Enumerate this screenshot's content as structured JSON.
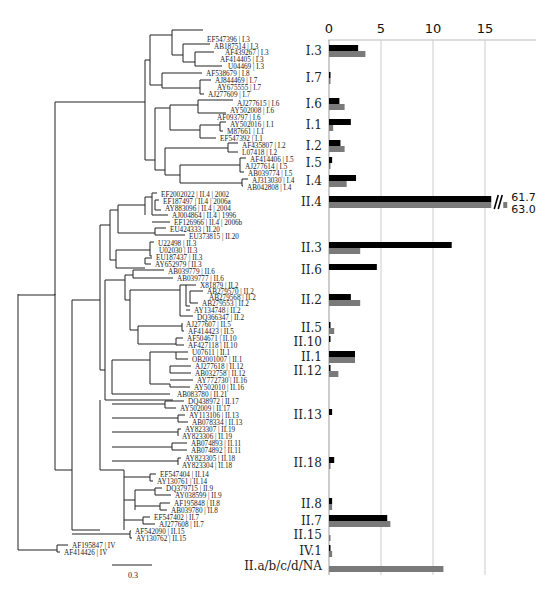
{
  "chart_data": {
    "type": "bar",
    "orientation": "horizontal",
    "title": "",
    "xlabel": "",
    "ylabel": "",
    "xlim": [
      0,
      20
    ],
    "x_ticks": [
      "0",
      "5",
      "10",
      "15"
    ],
    "grid": true,
    "legend": [],
    "categories": [
      "I.3",
      "I.7",
      "I.6",
      "I.1",
      "I.2",
      "I.5",
      "I.4",
      "II.4",
      "II.3",
      "II.6",
      "II.2",
      "II.5",
      "II.10",
      "II.1",
      "II.12",
      "II.13",
      "II.18",
      "II.8",
      "II.7",
      "II.15",
      "IV.1",
      "II.a/b/c/d/NA"
    ],
    "series": [
      {
        "name": "black",
        "color": "#000000",
        "values": [
          2.8,
          0.1,
          1.0,
          2.1,
          1.1,
          0.3,
          2.6,
          61.7,
          11.8,
          4.6,
          2.1,
          0.1,
          0.1,
          2.5,
          0.1,
          0.3,
          0.5,
          0.3,
          5.6,
          0.0,
          0.1,
          0.0
        ]
      },
      {
        "name": "gray",
        "color": "#7a7a7a",
        "values": [
          3.5,
          0.1,
          1.5,
          0.4,
          1.5,
          0.1,
          1.7,
          63.0,
          3.0,
          0.0,
          3.0,
          0.5,
          0.0,
          2.5,
          0.9,
          0.0,
          0.1,
          0.3,
          5.9,
          0.05,
          0.3,
          11.0
        ]
      }
    ],
    "annotations": [
      {
        "category": "II.4",
        "series": "black",
        "text": "61.7",
        "note": "axis break"
      },
      {
        "category": "II.4",
        "series": "gray",
        "text": "63.0",
        "note": "axis break"
      }
    ],
    "category_y": [
      51,
      78,
      104,
      125,
      146,
      163,
      181,
      202,
      248,
      270,
      300,
      328,
      342,
      357,
      371,
      415,
      463,
      504,
      521,
      535,
      551,
      566
    ]
  },
  "tree": {
    "scale_bar_label": "0.3",
    "leaves": [
      {
        "label": "EF547396 | I.3",
        "x": 205,
        "y": 39
      },
      {
        "label": "AB187514 | I.3",
        "x": 212,
        "y": 46
      },
      {
        "label": "AF439267 | I.3",
        "x": 223,
        "y": 52
      },
      {
        "label": "AF414405 | I.3",
        "x": 218,
        "y": 59
      },
      {
        "label": "U04469 | I.3",
        "x": 226,
        "y": 66
      },
      {
        "label": "AF538679 | I.8",
        "x": 204,
        "y": 73
      },
      {
        "label": "AJ844469 | I.7",
        "x": 213,
        "y": 80
      },
      {
        "label": "AY675555 | I.7",
        "x": 215,
        "y": 87
      },
      {
        "label": "AJ277609 | I.7",
        "x": 206,
        "y": 94
      },
      {
        "label": "AJ277615 | I.6",
        "x": 235,
        "y": 103
      },
      {
        "label": "AY502008 | I.6",
        "x": 228,
        "y": 110
      },
      {
        "label": "AF093797 | I.6",
        "x": 215,
        "y": 117
      },
      {
        "label": "AY502016 | I.1",
        "x": 228,
        "y": 124
      },
      {
        "label": "M87661 | I.1",
        "x": 225,
        "y": 131
      },
      {
        "label": "EF547392 | I.1",
        "x": 218,
        "y": 138
      },
      {
        "label": "AF435807 | I.2",
        "x": 240,
        "y": 145
      },
      {
        "label": "L07418 | I.2",
        "x": 240,
        "y": 152
      },
      {
        "label": "AF414406 | I.5",
        "x": 248,
        "y": 159
      },
      {
        "label": "AJ277614 | I.5",
        "x": 243,
        "y": 166
      },
      {
        "label": "AB039774 | I.5",
        "x": 246,
        "y": 173
      },
      {
        "label": "AJ313030 | I.4",
        "x": 250,
        "y": 180
      },
      {
        "label": "AB042808 | I.4",
        "x": 245,
        "y": 187
      },
      {
        "label": "EF2002022 | II.4 | 2002",
        "x": 159,
        "y": 194
      },
      {
        "label": "EF187497 | II.4 | 2006a",
        "x": 161,
        "y": 201
      },
      {
        "label": "AY883096 | II.4 | 2004",
        "x": 163,
        "y": 208
      },
      {
        "label": "AJ004864 | II.4 | 1996",
        "x": 170,
        "y": 215
      },
      {
        "label": "EF126966 | II.4 | 2006b",
        "x": 172,
        "y": 222
      },
      {
        "label": "EU424333 | II.20",
        "x": 168,
        "y": 229
      },
      {
        "label": "EU373815 | II.20",
        "x": 187,
        "y": 236
      },
      {
        "label": "U22498 | II.3",
        "x": 156,
        "y": 243
      },
      {
        "label": "U02030 | II.3",
        "x": 157,
        "y": 250
      },
      {
        "label": "EU187437 | II.3",
        "x": 154,
        "y": 257
      },
      {
        "label": "AY652979 | II.3",
        "x": 153,
        "y": 264
      },
      {
        "label": "AB039779 | II.6",
        "x": 166,
        "y": 271
      },
      {
        "label": "AB039777 | II.6",
        "x": 175,
        "y": 278
      },
      {
        "label": "X81879 | II.2",
        "x": 198,
        "y": 285
      },
      {
        "label": "AB279570 | II.2",
        "x": 205,
        "y": 291
      },
      {
        "label": "AB279568 | II.2",
        "x": 207,
        "y": 297
      },
      {
        "label": "AB279553 | II.2",
        "x": 200,
        "y": 303
      },
      {
        "label": "AY134748 | II.2",
        "x": 192,
        "y": 310
      },
      {
        "label": "DQ366347 | II.2",
        "x": 195,
        "y": 317
      },
      {
        "label": "AJ277607 | II.5",
        "x": 184,
        "y": 324
      },
      {
        "label": "AF414423 | II.5",
        "x": 186,
        "y": 331
      },
      {
        "label": "AF504671 | II.10",
        "x": 185,
        "y": 338
      },
      {
        "label": "AF427118 | II.10",
        "x": 186,
        "y": 345
      },
      {
        "label": "U07611 | II.1",
        "x": 190,
        "y": 352
      },
      {
        "label": "OB2001007 | II.1",
        "x": 190,
        "y": 359
      },
      {
        "label": "AJ277618 | II.12",
        "x": 193,
        "y": 366
      },
      {
        "label": "AB032758 | II.12",
        "x": 193,
        "y": 373
      },
      {
        "label": "AY772730 | II.16",
        "x": 195,
        "y": 380
      },
      {
        "label": "AY502010 | II.16",
        "x": 192,
        "y": 387
      },
      {
        "label": "AB083780 | II.21",
        "x": 175,
        "y": 394
      },
      {
        "label": "DQ438972 | II.17",
        "x": 186,
        "y": 401
      },
      {
        "label": "AY502009 | II.17",
        "x": 178,
        "y": 408
      },
      {
        "label": "AY113106 | II.13",
        "x": 187,
        "y": 415
      },
      {
        "label": "AB078334 | II.13",
        "x": 190,
        "y": 422
      },
      {
        "label": "AY823307 | II.19",
        "x": 183,
        "y": 429
      },
      {
        "label": "AY823306 | II.19",
        "x": 180,
        "y": 436
      },
      {
        "label": "AB074893 | II.11",
        "x": 189,
        "y": 443
      },
      {
        "label": "AB074892 | II.11",
        "x": 189,
        "y": 450
      },
      {
        "label": "AY823305 | II.18",
        "x": 183,
        "y": 458
      },
      {
        "label": "AY823304 | II.18",
        "x": 180,
        "y": 465
      },
      {
        "label": "EF547404 | II.14",
        "x": 158,
        "y": 474
      },
      {
        "label": "AY130761 | II.14",
        "x": 155,
        "y": 481
      },
      {
        "label": "DQ379715 | II.9",
        "x": 164,
        "y": 488
      },
      {
        "label": "AY038599 | II.9",
        "x": 173,
        "y": 495
      },
      {
        "label": "AF195848 | II.8",
        "x": 172,
        "y": 503
      },
      {
        "label": "AB039780 | II.8",
        "x": 169,
        "y": 510
      },
      {
        "label": "EF547402 | II.7",
        "x": 152,
        "y": 517
      },
      {
        "label": "AJ277608 | II.7",
        "x": 157,
        "y": 524
      },
      {
        "label": "AF542090 | II.15",
        "x": 133,
        "y": 531
      },
      {
        "label": "AY130762 | II.15",
        "x": 134,
        "y": 538
      },
      {
        "label": "AF195847 | IV",
        "x": 70,
        "y": 545
      },
      {
        "label": "AF414426 | IV",
        "x": 62,
        "y": 552
      }
    ]
  }
}
